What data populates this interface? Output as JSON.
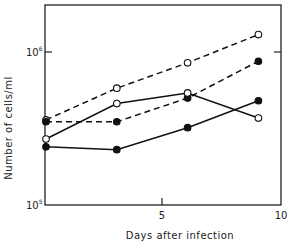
{
  "chart_data": {
    "type": "line",
    "title": "",
    "xlabel": "Days after infection",
    "ylabel": "Number of cells/ml",
    "yscale": "log",
    "xlim": [
      0,
      10
    ],
    "ylim": [
      100000,
      3000000
    ],
    "xticks": [
      0,
      5,
      10
    ],
    "xtick_labels": [
      "",
      "5",
      "10"
    ],
    "yticks": [
      100000,
      1000000
    ],
    "ytick_labels": [
      {
        "base": "10",
        "exp": "5"
      },
      {
        "base": "10",
        "exp": "6"
      }
    ],
    "grid": false,
    "legend": "none",
    "series": [
      {
        "name": "open circles, dashed",
        "marker": "open",
        "line": "dashed",
        "x": [
          0,
          3,
          6,
          9
        ],
        "values": [
          360000,
          580000,
          850000,
          1300000
        ]
      },
      {
        "name": "filled circles, dashed",
        "marker": "filled",
        "line": "dashed",
        "x": [
          0,
          3,
          6,
          9
        ],
        "values": [
          350000,
          350000,
          500000,
          870000
        ]
      },
      {
        "name": "open circles, solid",
        "marker": "open",
        "line": "solid",
        "x": [
          0,
          3,
          6,
          9
        ],
        "values": [
          270000,
          460000,
          540000,
          370000
        ]
      },
      {
        "name": "filled circles, solid",
        "marker": "filled",
        "line": "solid",
        "x": [
          0,
          3,
          6,
          9
        ],
        "values": [
          240000,
          230000,
          320000,
          480000
        ]
      }
    ]
  },
  "labels": {
    "xlabel": "Days after infection",
    "ylabel": "Number of cells/ml",
    "x5": "5",
    "x10": "10",
    "y_base": "10",
    "y5_exp": "5",
    "y6_exp": "6"
  }
}
